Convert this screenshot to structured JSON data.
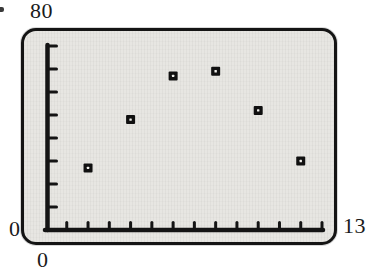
{
  "figure": {
    "labels": {
      "y_max": "80",
      "y_min": "0",
      "x_min": "0",
      "x_max": "13"
    },
    "colors": {
      "axis": "#141414",
      "panel_border": "#141414",
      "panel_bg": "#e7e6e2",
      "marker": "#101010",
      "marker_center": "#efeeea",
      "page_bg": "#ffffff"
    }
  },
  "chart_data": {
    "type": "scatter",
    "title": "",
    "xlabel": "",
    "ylabel": "",
    "xlim": [
      0,
      13
    ],
    "ylim": [
      0,
      80
    ],
    "x_tick_interval": 1,
    "y_tick_interval": 10,
    "grid": false,
    "legend": false,
    "marker_style": "filled-square-with-white-center-dot",
    "axis_corner_labels": {
      "y_top": "80",
      "origin_y": "0",
      "origin_x": "0",
      "x_right": "13"
    },
    "points": [
      {
        "x": 2,
        "y": 27
      },
      {
        "x": 4,
        "y": 48
      },
      {
        "x": 6,
        "y": 67
      },
      {
        "x": 8,
        "y": 69
      },
      {
        "x": 10,
        "y": 52
      },
      {
        "x": 12,
        "y": 30
      }
    ]
  }
}
